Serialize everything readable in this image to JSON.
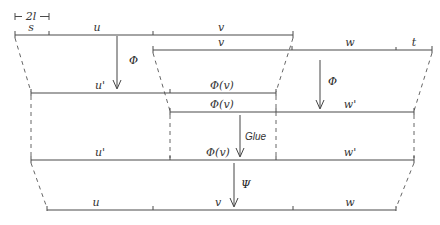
{
  "diagram": {
    "scale_marker": {
      "label": "2l"
    },
    "rows": [
      {
        "id": "top-row-1",
        "y": 35,
        "labels": [
          "s",
          "u",
          "v"
        ]
      },
      {
        "id": "top-row-2",
        "y": 50,
        "labels": [
          "v",
          "w",
          "t"
        ]
      },
      {
        "id": "mid-row-1",
        "y": 93,
        "labels": [
          "u'",
          "Φ(v)"
        ]
      },
      {
        "id": "mid-row-2",
        "y": 112,
        "labels": [
          "Φ(v)",
          "w'"
        ]
      },
      {
        "id": "glued-row",
        "y": 160,
        "labels": [
          "u'",
          "Φ(v)",
          "w'"
        ]
      },
      {
        "id": "bottom-row",
        "y": 210,
        "labels": [
          "u",
          "v",
          "w"
        ]
      }
    ],
    "arrows": {
      "phi_left": "Φ",
      "phi_right": "Φ",
      "glue": "Glue",
      "psi": "Ψ"
    }
  }
}
